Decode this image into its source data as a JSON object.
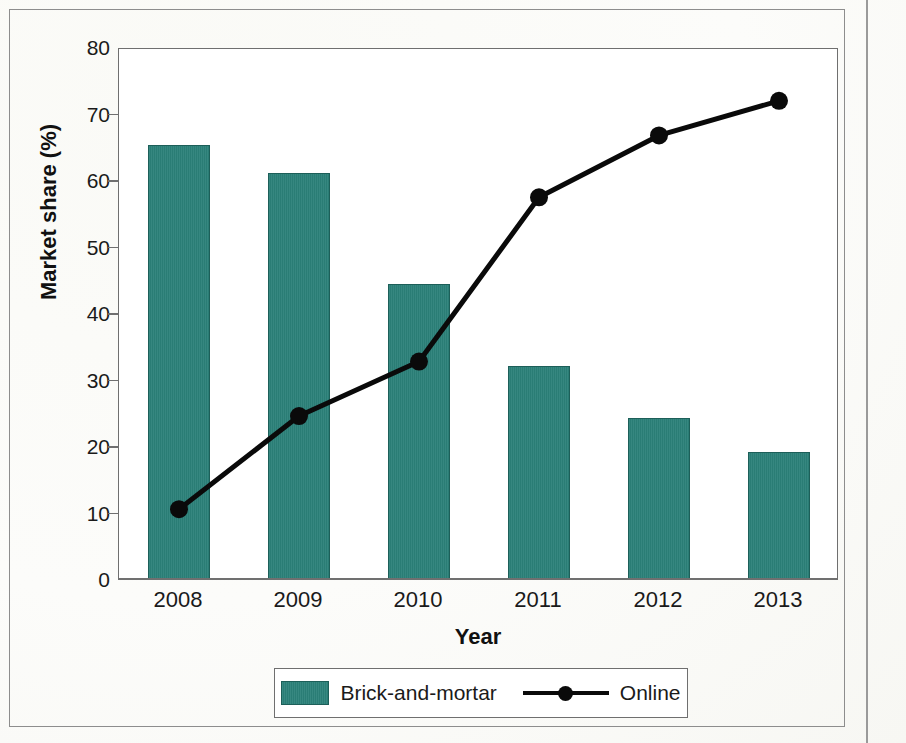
{
  "chart_data": {
    "type": "bar",
    "title": "",
    "subtitle": "",
    "xlabel": "Year",
    "ylabel": "Market share (%)",
    "categories": [
      "2008",
      "2009",
      "2010",
      "2011",
      "2012",
      "2013"
    ],
    "series": [
      {
        "name": "Brick-and-mortar",
        "type": "bar",
        "color": "#2b8179",
        "values": [
          65.2,
          61.1,
          44.4,
          32.1,
          24.2,
          19.1
        ]
      },
      {
        "name": "Online",
        "type": "line",
        "color": "#0a0a0a",
        "values": [
          10.8,
          24.8,
          33.0,
          57.7,
          67.0,
          72.2
        ]
      }
    ],
    "ylim": [
      0,
      80
    ],
    "y_ticks": [
      0,
      10,
      20,
      30,
      40,
      50,
      60,
      70,
      80
    ],
    "y_tick_labels": [
      "0",
      "10",
      "20",
      "30",
      "40",
      "50",
      "60",
      "70",
      "80"
    ],
    "grid": false,
    "legend_position": "bottom"
  },
  "axes": {
    "y_title": "Market share (%)",
    "x_title": "Year"
  },
  "legend": {
    "items": [
      {
        "label": "Brick-and-mortar",
        "marker": "swatch",
        "color": "#2b8179"
      },
      {
        "label": "Online",
        "marker": "line-dot",
        "color": "#0a0a0a"
      }
    ]
  },
  "page": {
    "edge_marks": ""
  }
}
